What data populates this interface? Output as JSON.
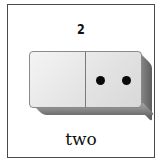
{
  "card": {
    "numeral": "2",
    "word": "two",
    "domino": {
      "left_pips": 0,
      "right_pips": 2
    }
  }
}
